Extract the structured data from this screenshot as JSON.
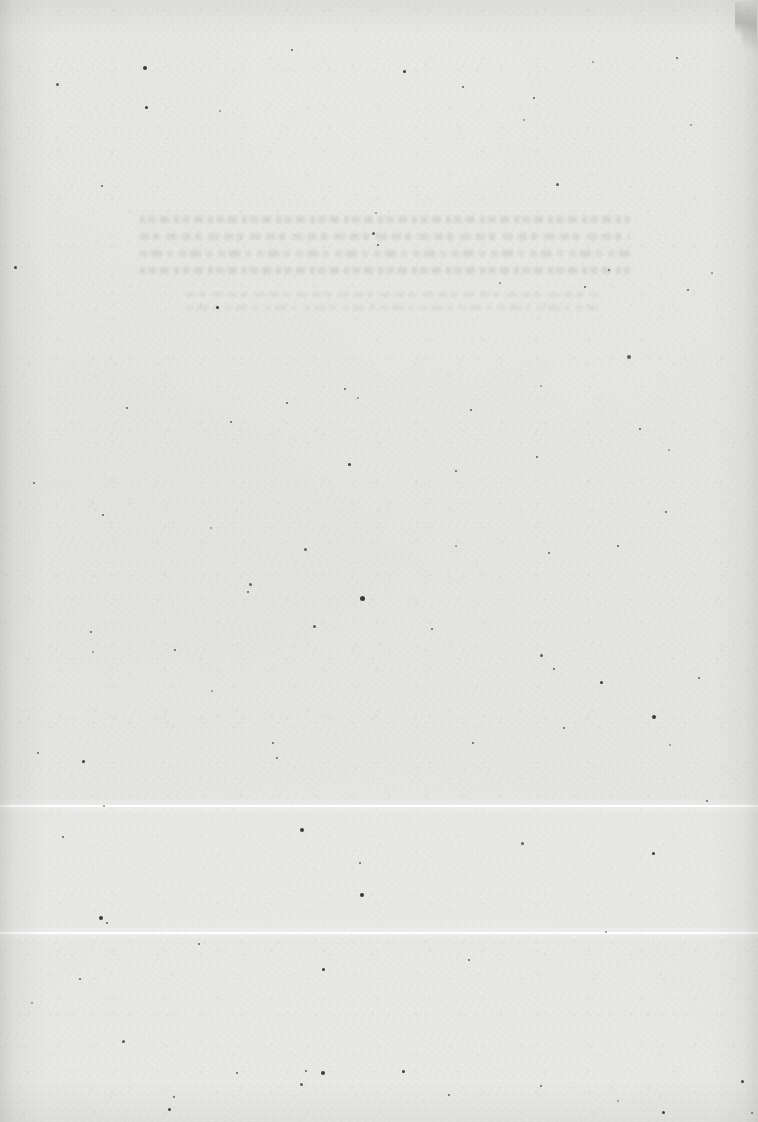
{
  "document": {
    "kind": "scanned-page",
    "condition": "blank / faded — no legible text",
    "page_width": 758,
    "page_height": 1122,
    "paper_color": "#e9e9e7",
    "paper_tone_light": "#ececea",
    "paper_tone_dark": "#e6e6e4",
    "ink_ghost_color": "#78787 6",
    "speck_color": "#5d5d5b",
    "speck_color_dark": "#3a3a38",
    "speck_color_light": "#8e8e8c",
    "scanline_color": "#ffffff"
  },
  "artifacts": {
    "scanlines": [
      {
        "name": "scanline-upper",
        "y": 805
      },
      {
        "name": "scanline-lower",
        "y": 932
      }
    ],
    "corner_scratch": {
      "corner": "top-right",
      "x": 735,
      "y": 2
    },
    "vignette_edges": [
      "left",
      "right",
      "top",
      "bottom"
    ]
  },
  "ghost_text": {
    "heading_block": {
      "x": 140,
      "y": 216,
      "width": 490,
      "line_count": 4,
      "legible": false,
      "note": "faded heading-weight rows, glyphs unreadable"
    },
    "body_block": {
      "x": 186,
      "y": 292,
      "width": 412,
      "line_count": 2,
      "legible": false,
      "note": "faded body rows, glyphs unreadable"
    }
  },
  "specks": [
    {
      "x": 56,
      "y": 83,
      "s": 3,
      "t": "soft"
    },
    {
      "x": 143,
      "y": 66,
      "s": 4,
      "t": "dark"
    },
    {
      "x": 145,
      "y": 106,
      "s": 3,
      "t": "dark"
    },
    {
      "x": 219,
      "y": 110,
      "s": 2,
      "t": "light"
    },
    {
      "x": 291,
      "y": 49,
      "s": 2,
      "t": "soft"
    },
    {
      "x": 403,
      "y": 70,
      "s": 3,
      "t": "dark"
    },
    {
      "x": 462,
      "y": 86,
      "s": 2,
      "t": "soft"
    },
    {
      "x": 523,
      "y": 119,
      "s": 2,
      "t": "light"
    },
    {
      "x": 556,
      "y": 183,
      "s": 3,
      "t": "soft"
    },
    {
      "x": 533,
      "y": 97,
      "s": 2,
      "t": "soft"
    },
    {
      "x": 592,
      "y": 61,
      "s": 2,
      "t": "light"
    },
    {
      "x": 676,
      "y": 57,
      "s": 2,
      "t": "soft"
    },
    {
      "x": 690,
      "y": 124,
      "s": 2,
      "t": "light"
    },
    {
      "x": 14,
      "y": 266,
      "s": 3,
      "t": "dark"
    },
    {
      "x": 101,
      "y": 185,
      "s": 2,
      "t": "soft"
    },
    {
      "x": 372,
      "y": 232,
      "s": 3,
      "t": "soft"
    },
    {
      "x": 377,
      "y": 244,
      "s": 2,
      "t": "soft"
    },
    {
      "x": 375,
      "y": 212,
      "s": 2,
      "t": "light"
    },
    {
      "x": 627,
      "y": 355,
      "s": 4,
      "t": "soft"
    },
    {
      "x": 584,
      "y": 286,
      "s": 2,
      "t": "soft"
    },
    {
      "x": 499,
      "y": 282,
      "s": 2,
      "t": "light"
    },
    {
      "x": 687,
      "y": 289,
      "s": 2,
      "t": "soft"
    },
    {
      "x": 711,
      "y": 272,
      "s": 2,
      "t": "light"
    },
    {
      "x": 608,
      "y": 269,
      "s": 2,
      "t": "soft"
    },
    {
      "x": 216,
      "y": 306,
      "s": 3,
      "t": "dark"
    },
    {
      "x": 286,
      "y": 402,
      "s": 2,
      "t": "soft"
    },
    {
      "x": 357,
      "y": 397,
      "s": 2,
      "t": "light"
    },
    {
      "x": 230,
      "y": 421,
      "s": 2,
      "t": "soft"
    },
    {
      "x": 344,
      "y": 388,
      "s": 2,
      "t": "soft"
    },
    {
      "x": 470,
      "y": 409,
      "s": 2,
      "t": "soft"
    },
    {
      "x": 540,
      "y": 385,
      "s": 2,
      "t": "light"
    },
    {
      "x": 126,
      "y": 407,
      "s": 2,
      "t": "soft"
    },
    {
      "x": 536,
      "y": 456,
      "s": 2,
      "t": "soft"
    },
    {
      "x": 455,
      "y": 470,
      "s": 2,
      "t": "soft"
    },
    {
      "x": 348,
      "y": 463,
      "s": 3,
      "t": "dark"
    },
    {
      "x": 639,
      "y": 428,
      "s": 2,
      "t": "soft"
    },
    {
      "x": 668,
      "y": 449,
      "s": 2,
      "t": "light"
    },
    {
      "x": 33,
      "y": 482,
      "s": 2,
      "t": "soft"
    },
    {
      "x": 102,
      "y": 514,
      "s": 2,
      "t": "soft"
    },
    {
      "x": 210,
      "y": 527,
      "s": 2,
      "t": "light"
    },
    {
      "x": 304,
      "y": 548,
      "s": 3,
      "t": "soft"
    },
    {
      "x": 360,
      "y": 596,
      "s": 5,
      "t": "dark"
    },
    {
      "x": 313,
      "y": 625,
      "s": 3,
      "t": "soft"
    },
    {
      "x": 249,
      "y": 583,
      "s": 3,
      "t": "soft"
    },
    {
      "x": 247,
      "y": 591,
      "s": 2,
      "t": "soft"
    },
    {
      "x": 455,
      "y": 545,
      "s": 2,
      "t": "light"
    },
    {
      "x": 548,
      "y": 552,
      "s": 2,
      "t": "soft"
    },
    {
      "x": 617,
      "y": 545,
      "s": 2,
      "t": "soft"
    },
    {
      "x": 665,
      "y": 511,
      "s": 2,
      "t": "soft"
    },
    {
      "x": 90,
      "y": 631,
      "s": 2,
      "t": "soft"
    },
    {
      "x": 174,
      "y": 649,
      "s": 2,
      "t": "soft"
    },
    {
      "x": 92,
      "y": 651,
      "s": 2,
      "t": "light"
    },
    {
      "x": 431,
      "y": 628,
      "s": 2,
      "t": "soft"
    },
    {
      "x": 540,
      "y": 654,
      "s": 3,
      "t": "soft"
    },
    {
      "x": 553,
      "y": 668,
      "s": 2,
      "t": "soft"
    },
    {
      "x": 600,
      "y": 681,
      "s": 3,
      "t": "dark"
    },
    {
      "x": 652,
      "y": 715,
      "s": 4,
      "t": "dark"
    },
    {
      "x": 698,
      "y": 677,
      "s": 2,
      "t": "soft"
    },
    {
      "x": 37,
      "y": 752,
      "s": 2,
      "t": "soft"
    },
    {
      "x": 82,
      "y": 760,
      "s": 3,
      "t": "dark"
    },
    {
      "x": 272,
      "y": 742,
      "s": 2,
      "t": "soft"
    },
    {
      "x": 276,
      "y": 757,
      "s": 2,
      "t": "soft"
    },
    {
      "x": 211,
      "y": 690,
      "s": 2,
      "t": "light"
    },
    {
      "x": 472,
      "y": 742,
      "s": 2,
      "t": "soft"
    },
    {
      "x": 563,
      "y": 727,
      "s": 2,
      "t": "soft"
    },
    {
      "x": 669,
      "y": 744,
      "s": 2,
      "t": "light"
    },
    {
      "x": 300,
      "y": 828,
      "s": 4,
      "t": "dark"
    },
    {
      "x": 62,
      "y": 836,
      "s": 2,
      "t": "soft"
    },
    {
      "x": 103,
      "y": 805,
      "s": 2,
      "t": "light"
    },
    {
      "x": 359,
      "y": 862,
      "s": 2,
      "t": "soft"
    },
    {
      "x": 521,
      "y": 842,
      "s": 3,
      "t": "soft"
    },
    {
      "x": 652,
      "y": 852,
      "s": 3,
      "t": "dark"
    },
    {
      "x": 706,
      "y": 800,
      "s": 2,
      "t": "soft"
    },
    {
      "x": 360,
      "y": 893,
      "s": 4,
      "t": "dark"
    },
    {
      "x": 99,
      "y": 916,
      "s": 4,
      "t": "dark"
    },
    {
      "x": 106,
      "y": 922,
      "s": 2,
      "t": "soft"
    },
    {
      "x": 198,
      "y": 943,
      "s": 2,
      "t": "soft"
    },
    {
      "x": 322,
      "y": 968,
      "s": 3,
      "t": "dark"
    },
    {
      "x": 79,
      "y": 978,
      "s": 2,
      "t": "soft"
    },
    {
      "x": 31,
      "y": 1002,
      "s": 2,
      "t": "light"
    },
    {
      "x": 468,
      "y": 959,
      "s": 2,
      "t": "soft"
    },
    {
      "x": 605,
      "y": 931,
      "s": 2,
      "t": "light"
    },
    {
      "x": 122,
      "y": 1040,
      "s": 3,
      "t": "soft"
    },
    {
      "x": 168,
      "y": 1108,
      "s": 3,
      "t": "dark"
    },
    {
      "x": 236,
      "y": 1072,
      "s": 2,
      "t": "soft"
    },
    {
      "x": 300,
      "y": 1083,
      "s": 3,
      "t": "soft"
    },
    {
      "x": 305,
      "y": 1070,
      "s": 2,
      "t": "soft"
    },
    {
      "x": 321,
      "y": 1071,
      "s": 4,
      "t": "dark"
    },
    {
      "x": 402,
      "y": 1070,
      "s": 3,
      "t": "dark"
    },
    {
      "x": 448,
      "y": 1094,
      "s": 2,
      "t": "soft"
    },
    {
      "x": 540,
      "y": 1085,
      "s": 2,
      "t": "soft"
    },
    {
      "x": 617,
      "y": 1100,
      "s": 2,
      "t": "light"
    },
    {
      "x": 662,
      "y": 1111,
      "s": 3,
      "t": "dark"
    },
    {
      "x": 741,
      "y": 1080,
      "s": 3,
      "t": "dark"
    },
    {
      "x": 751,
      "y": 1112,
      "s": 2,
      "t": "soft"
    },
    {
      "x": 173,
      "y": 1096,
      "s": 2,
      "t": "soft"
    }
  ]
}
